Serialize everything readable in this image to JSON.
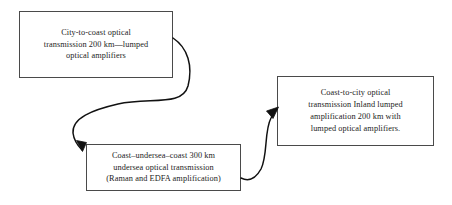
{
  "diagram": {
    "type": "flowchart",
    "background_color": "#ffffff",
    "text_color": "#1c1c1c",
    "border_color": "#4a4a4a",
    "arrow_color": "#111111",
    "boxes": [
      {
        "id": "city-to-coast",
        "text": "City-to-coast optical\ntransmission 200 km—lumped\noptical amplifiers"
      },
      {
        "id": "undersea",
        "text": "Coast–undersea–coast  300 km\nundersea optical transmission\n(Raman and EDFA amplification)"
      },
      {
        "id": "coast-to-city",
        "text": "Coast-to-city optical\ntransmission Inland lumped\namplification 200 km with\nlumped optical amplifiers."
      }
    ],
    "connectors": [
      {
        "id": "city-to-undersea",
        "from": "city-to-coast",
        "to": "undersea",
        "style": "curved-arrow"
      },
      {
        "id": "undersea-to-coast-city",
        "from": "undersea",
        "to": "coast-to-city",
        "style": "curved-arrow"
      }
    ]
  }
}
